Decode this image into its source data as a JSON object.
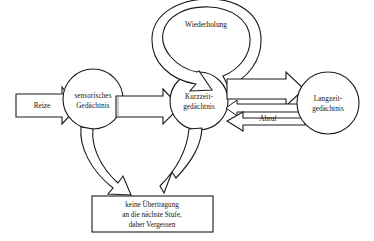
{
  "diagram": {
    "background_color": "#ffffff",
    "line_color": "#1a1a1a",
    "nodes": [
      {
        "id": "sensory",
        "shape": "circle",
        "label_line1": "sensorisches",
        "label_line2": "Gedächtnis",
        "cx": 93,
        "cy": 99,
        "r": 30
      },
      {
        "id": "short_term",
        "shape": "circle",
        "label_line1": "Kurzzeit-",
        "label_line2": "gedächtnis",
        "cx": 199,
        "cy": 101,
        "r": 29
      },
      {
        "id": "long_term",
        "shape": "circle",
        "label_line1": "Langzeit-",
        "label_line2": "gedächtnis",
        "cx": 328,
        "cy": 103,
        "r": 31
      }
    ],
    "forget_box": {
      "id": "forgetting",
      "shape": "rectangle",
      "label_line1": "keine Übertragung",
      "label_line2": "an die nächste Stufe,",
      "label_line3": "daher Vergessen",
      "x": 92,
      "y": 196,
      "width": 121,
      "height": 36
    },
    "arrows": [
      {
        "id": "stimuli",
        "label": "Reize",
        "from": "external",
        "to": "sensory",
        "style": "block-arrow-with-label"
      },
      {
        "id": "sensory-to-short",
        "label": "",
        "from": "sensory",
        "to": "short_term",
        "style": "block-arrow"
      },
      {
        "id": "rehearsal-loop",
        "label": "Wiederholung",
        "from": "short_term",
        "to": "short_term",
        "style": "curved-ring-arrow"
      },
      {
        "id": "short-to-long",
        "label": "",
        "from": "short_term",
        "to": "long_term",
        "style": "block-arrow"
      },
      {
        "id": "retrieval",
        "label": "Abruf",
        "from": "long_term",
        "to": "short_term",
        "style": "thin-bar-arrow-with-label"
      },
      {
        "id": "sensory-forgetting",
        "label": "",
        "from": "sensory",
        "to": "forgetting",
        "style": "curved-block-arrow"
      },
      {
        "id": "short-forgetting",
        "label": "",
        "from": "short_term",
        "to": "forgetting",
        "style": "curved-block-arrow"
      }
    ]
  }
}
